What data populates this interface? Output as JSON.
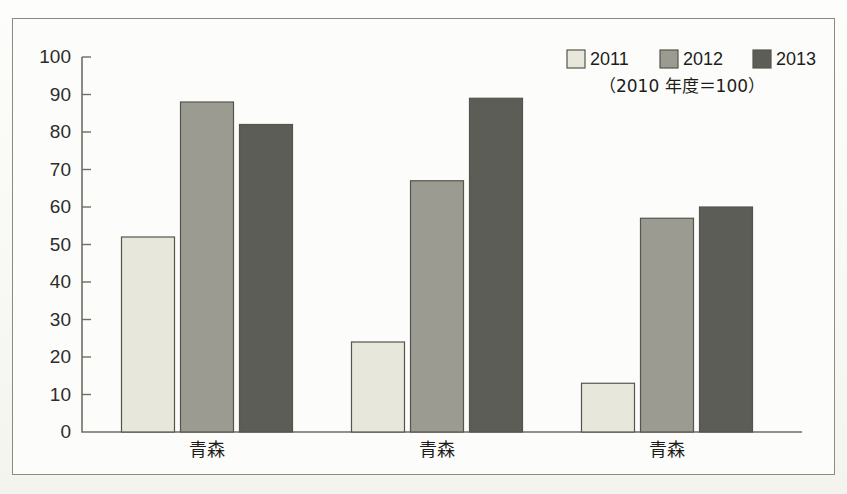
{
  "page": {
    "background_color": "#fbfbf8",
    "frame_border_color": "#8b8b82"
  },
  "legend": {
    "entries": [
      {
        "label": "2011",
        "color": "#e7e7dc"
      },
      {
        "label": "2012",
        "color": "#9b9b92"
      },
      {
        "label": "2013",
        "color": "#5d5d57"
      }
    ],
    "note": "（2010 年度＝100）"
  },
  "chart_data": {
    "type": "bar",
    "title": "",
    "subtitle": "",
    "xlabel": "",
    "ylabel": "",
    "categories": [
      "青森",
      "青森",
      "青森"
    ],
    "series": [
      {
        "name": "2011",
        "color": "#e7e7dc",
        "values": [
          52,
          24,
          13
        ]
      },
      {
        "name": "2012",
        "color": "#9b9b92",
        "values": [
          88,
          67,
          57
        ]
      },
      {
        "name": "2013",
        "color": "#5d5d57",
        "values": [
          82,
          89,
          60
        ]
      }
    ],
    "ylim": [
      0,
      100
    ],
    "ytick_step": 10,
    "ytick_labels": [
      "0",
      "10",
      "20",
      "30",
      "40",
      "50",
      "60",
      "70",
      "80",
      "90",
      "100"
    ],
    "grid": false,
    "legend_position": "top-right",
    "annotations": [
      "（2010 年度＝100）"
    ]
  }
}
